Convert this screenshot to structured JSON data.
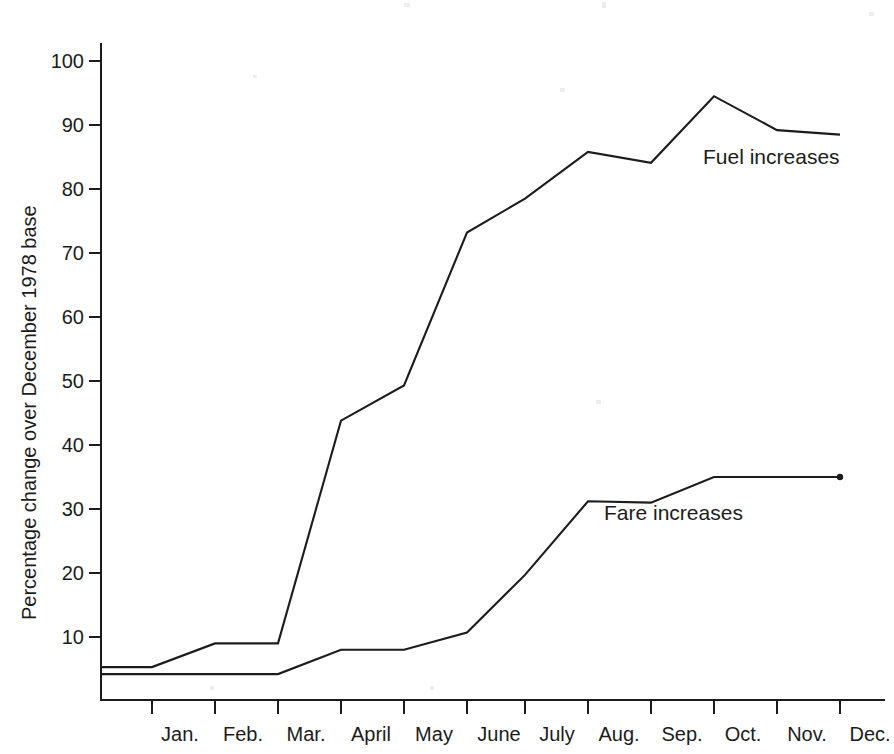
{
  "chart_data": {
    "type": "line",
    "title": "",
    "subtitle": "",
    "xlabel": "",
    "ylabel": "Percentage change over December 1978 base",
    "categories": [
      "Jan.",
      "Feb.",
      "Mar.",
      "April",
      "May",
      "June",
      "July",
      "Aug.",
      "Sep.",
      "Oct.",
      "Nov.",
      "Dec."
    ],
    "x_tick_labels": [
      "Jan.",
      "Feb.",
      "Mar.",
      "April",
      "May",
      "June",
      "July",
      "Aug.",
      "Sep.",
      "Oct.",
      "Nov.",
      "Dec."
    ],
    "y_tick_labels": [
      "10",
      "20",
      "30",
      "40",
      "50",
      "60",
      "70",
      "80",
      "90",
      "100"
    ],
    "y_ticks": [
      10,
      20,
      30,
      40,
      50,
      60,
      70,
      80,
      90,
      100
    ],
    "ylim": [
      0,
      105
    ],
    "xlim_note": "axis begins just left of Jan. and ends at Dec.",
    "grid": false,
    "legend_position": "inline-annotations",
    "series": [
      {
        "name": "Fuel increases",
        "label": "Fuel increases",
        "color": "#1c1c1c",
        "values": [
          5.3,
          9.0,
          9.0,
          43.8,
          49.3,
          73.2,
          78.5,
          85.8,
          84.1,
          94.5,
          89.2,
          88.5
        ],
        "annotation": "Fuel increases"
      },
      {
        "name": "Fare increases",
        "label": "Fare increases",
        "color": "#1c1c1c",
        "values": [
          4.2,
          4.2,
          4.2,
          8.0,
          8.0,
          10.7,
          19.7,
          31.2,
          31.0,
          35.0,
          35.0,
          35.0
        ],
        "annotation": "Fare increases"
      }
    ],
    "annotations": [
      {
        "text": "Fuel increases",
        "x": "Oct.",
        "y": 80,
        "name": "fuel-increases-label"
      },
      {
        "text": "Fare increases",
        "x": "Sep.",
        "y": 28,
        "name": "fare-increases-label"
      }
    ]
  },
  "figure": {
    "y_axis_title": "Percentage change over December 1978 base",
    "series_one_label": "Fuel increases",
    "series_two_label": "Fare increases",
    "y_tick_100": "100",
    "y_tick_90": "90",
    "y_tick_80": "80",
    "y_tick_70": "70",
    "y_tick_60": "60",
    "y_tick_50": "50",
    "y_tick_40": "40",
    "y_tick_30": "30",
    "y_tick_20": "20",
    "y_tick_10": "10",
    "x_tick_jan": "Jan.",
    "x_tick_feb": "Feb.",
    "x_tick_mar": "Mar.",
    "x_tick_apr": "April",
    "x_tick_may": "May",
    "x_tick_jun": "June",
    "x_tick_jul": "July",
    "x_tick_aug": "Aug.",
    "x_tick_sep": "Sep.",
    "x_tick_oct": "Oct.",
    "x_tick_nov": "Nov.",
    "x_tick_dec": "Dec."
  }
}
